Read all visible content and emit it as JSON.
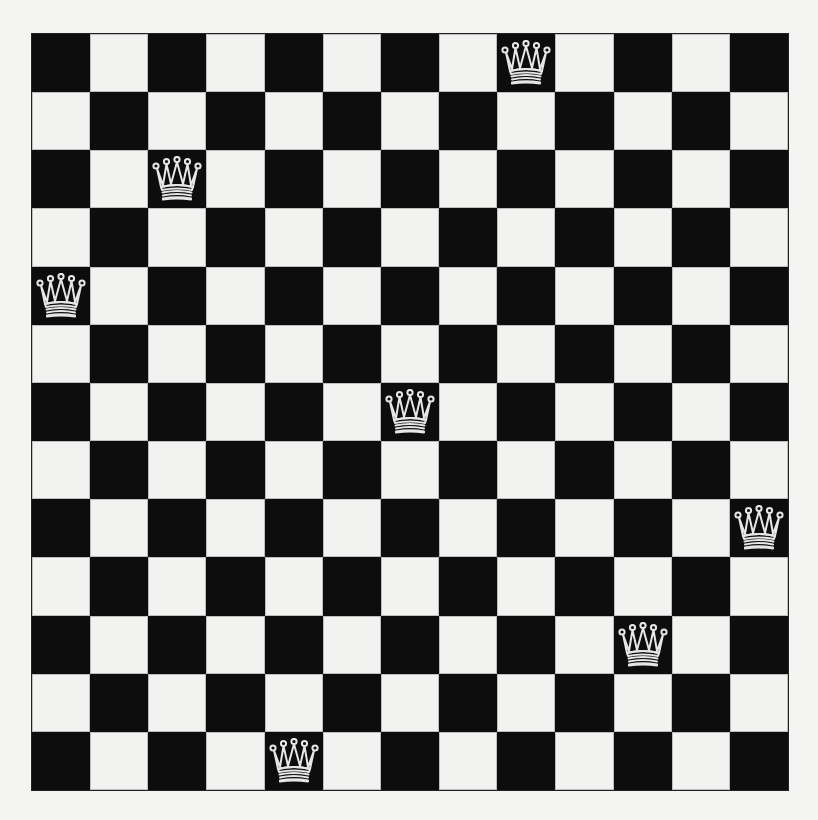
{
  "board": {
    "size": 13,
    "top_left_color": "dark",
    "colors": {
      "dark": "#0d0d0d",
      "light": "#f2f2f0",
      "background": "#f4f4f2",
      "piece_outline": "#e6e6e6"
    },
    "piece_icon": "queen-icon",
    "queens": [
      {
        "row": 0,
        "col": 8
      },
      {
        "row": 2,
        "col": 2
      },
      {
        "row": 4,
        "col": 0
      },
      {
        "row": 6,
        "col": 6
      },
      {
        "row": 8,
        "col": 12
      },
      {
        "row": 10,
        "col": 10
      },
      {
        "row": 12,
        "col": 4
      }
    ]
  }
}
